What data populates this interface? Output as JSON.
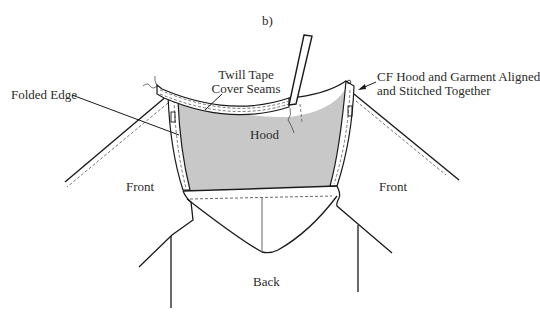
{
  "figure": {
    "panel_label": "b)",
    "labels": {
      "twill_tape_line1": "Twill Tape",
      "twill_tape_line2": "Cover Seams",
      "folded_edge": "Folded Edge",
      "cf_line1": "CF Hood and Garment Aligned",
      "cf_line2": "and Stitched Together",
      "hood": "Hood",
      "front_left": "Front",
      "front_right": "Front",
      "back": "Back"
    },
    "colors": {
      "line": "#1a1a1a",
      "hood_fill": "#c8c8c8",
      "stitch": "#555555",
      "background": "#ffffff"
    }
  }
}
